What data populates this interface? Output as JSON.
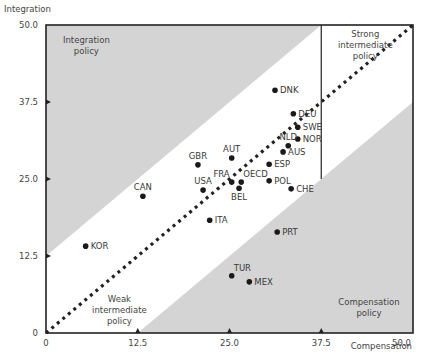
{
  "chart_data": {
    "type": "scatter",
    "title": "",
    "xlabel": "Compensation",
    "ylabel": "Integration",
    "xlim": [
      0,
      50
    ],
    "ylim": [
      0,
      50
    ],
    "x_ticks": [
      "0",
      "12.5",
      "25.0",
      "37.5",
      "50.0"
    ],
    "y_ticks": [
      "0",
      "12.5",
      "25.0",
      "37.5",
      "50.0"
    ],
    "grid": false,
    "diagonal": {
      "from": [
        0,
        0
      ],
      "to": [
        50,
        50
      ],
      "style": "dotted"
    },
    "shaded_regions": [
      {
        "name": "Integration policy",
        "polygon": [
          [
            0,
            12.5
          ],
          [
            0,
            50
          ],
          [
            37.5,
            50
          ]
        ]
      },
      {
        "name": "Compensation policy",
        "polygon": [
          [
            12.5,
            0
          ],
          [
            50,
            0
          ],
          [
            50,
            37.5
          ]
        ]
      }
    ],
    "divider": {
      "x": 37.5,
      "from_y": 25,
      "to_y": 50
    },
    "region_labels": [
      {
        "text": [
          "Integration",
          "policy"
        ],
        "x": 5.5,
        "y": 47
      },
      {
        "text": [
          "Strong",
          "intermediate",
          "policy"
        ],
        "x": 43.5,
        "y": 48
      },
      {
        "text": [
          "Weak",
          "intermediate",
          "policy"
        ],
        "x": 10,
        "y": 5
      },
      {
        "text": [
          "Compensation",
          "policy"
        ],
        "x": 44,
        "y": 4.5
      }
    ],
    "points": [
      {
        "label": "DNK",
        "x": 31.2,
        "y": 39.4
      },
      {
        "label": "DEU",
        "x": 33.7,
        "y": 35.6
      },
      {
        "label": "SWE",
        "x": 34.3,
        "y": 33.4
      },
      {
        "label": "NOR",
        "x": 34.3,
        "y": 31.5
      },
      {
        "label": "NLD",
        "x": 33.0,
        "y": 30.4
      },
      {
        "label": "AUS",
        "x": 32.3,
        "y": 29.4
      },
      {
        "label": "ESP",
        "x": 30.4,
        "y": 27.4
      },
      {
        "label": "AUT",
        "x": 25.3,
        "y": 28.4
      },
      {
        "label": "GBR",
        "x": 20.7,
        "y": 27.3
      },
      {
        "label": "FRA",
        "x": 25.3,
        "y": 24.5
      },
      {
        "label": "OECD",
        "x": 26.6,
        "y": 24.5
      },
      {
        "label": "BEL",
        "x": 26.3,
        "y": 23.5
      },
      {
        "label": "POL",
        "x": 30.4,
        "y": 24.7
      },
      {
        "label": "CHE",
        "x": 33.4,
        "y": 23.4
      },
      {
        "label": "USA",
        "x": 21.4,
        "y": 23.2
      },
      {
        "label": "CAN",
        "x": 13.2,
        "y": 22.2
      },
      {
        "label": "ITA",
        "x": 22.3,
        "y": 18.3
      },
      {
        "label": "KOR",
        "x": 5.4,
        "y": 14.1
      },
      {
        "label": "PRT",
        "x": 31.5,
        "y": 16.4
      },
      {
        "label": "TUR",
        "x": 25.3,
        "y": 9.3
      },
      {
        "label": "MEX",
        "x": 27.7,
        "y": 8.3
      }
    ],
    "label_positions": {
      "DNK": "right",
      "DEU": "right",
      "SWE": "right",
      "NOR": "right",
      "NLD": "top",
      "AUS": "right",
      "ESP": "right",
      "AUT": "top",
      "GBR": "top",
      "FRA": "top-left",
      "OECD": "top-right",
      "BEL": "bottom",
      "POL": "right",
      "CHE": "right",
      "USA": "top",
      "CAN": "top",
      "ITA": "right",
      "KOR": "right",
      "PRT": "right",
      "TUR": "top-right",
      "MEX": "right"
    }
  },
  "colors": {
    "shade": "#d4d4d4",
    "frame": "#222222",
    "point": "#1a1a1a",
    "text": "#3a3a3a"
  }
}
